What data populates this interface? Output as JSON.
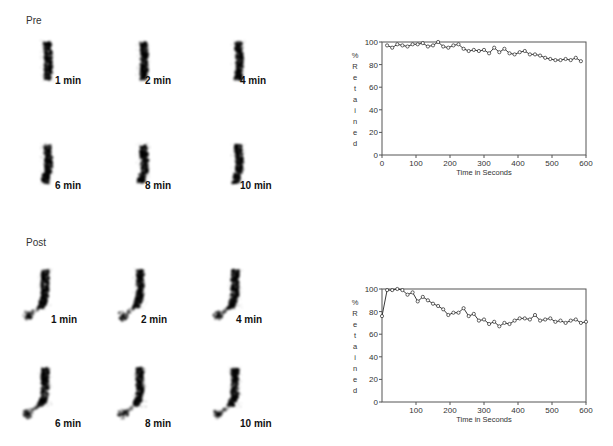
{
  "figure": {
    "panels": [
      {
        "id": "pre",
        "label": "Pre",
        "scans": [
          {
            "label": "1 min"
          },
          {
            "label": "2 min"
          },
          {
            "label": "4 min"
          },
          {
            "label": "6 min"
          },
          {
            "label": "8 min"
          },
          {
            "label": "10 min"
          }
        ]
      },
      {
        "id": "post",
        "label": "Post",
        "scans": [
          {
            "label": "1 min"
          },
          {
            "label": "2 min"
          },
          {
            "label": "4 min"
          },
          {
            "label": "6 min"
          },
          {
            "label": "8 min"
          },
          {
            "label": "10 min"
          }
        ]
      }
    ]
  },
  "chart_data": [
    {
      "type": "line",
      "panel": "Pre",
      "title": "",
      "xlabel": "Time in Seconds",
      "ylabel": "% Retained",
      "xlim": [
        0,
        600
      ],
      "ylim": [
        0,
        100
      ],
      "xticks": [
        0,
        100,
        200,
        300,
        400,
        500,
        600
      ],
      "yticks": [
        0,
        20,
        40,
        60,
        80,
        100
      ],
      "grid": false,
      "marker": "circle-open",
      "series": [
        {
          "name": "Pre",
          "x": [
            15,
            30,
            45,
            60,
            75,
            90,
            105,
            120,
            135,
            150,
            165,
            180,
            195,
            210,
            225,
            240,
            255,
            270,
            285,
            300,
            315,
            330,
            345,
            360,
            375,
            390,
            405,
            420,
            435,
            450,
            465,
            480,
            495,
            510,
            525,
            540,
            555,
            570,
            585
          ],
          "values": [
            97,
            95,
            98,
            97,
            96,
            98,
            98,
            99,
            96,
            97,
            100,
            96,
            95,
            97,
            98,
            94,
            92,
            93,
            92,
            93,
            90,
            95,
            91,
            94,
            90,
            89,
            91,
            92,
            89,
            89,
            88,
            86,
            85,
            84,
            84,
            85,
            84,
            86,
            83
          ]
        }
      ]
    },
    {
      "type": "line",
      "panel": "Post",
      "title": "",
      "xlabel": "Time in Seconds",
      "ylabel": "% Retained",
      "xlim": [
        0,
        600
      ],
      "ylim": [
        0,
        100
      ],
      "xticks": [
        100,
        200,
        300,
        400,
        500,
        600
      ],
      "yticks": [
        0,
        20,
        40,
        60,
        80,
        100
      ],
      "grid": false,
      "marker": "circle-open",
      "series": [
        {
          "name": "Post",
          "x": [
            0,
            15,
            30,
            45,
            60,
            75,
            90,
            105,
            120,
            135,
            150,
            165,
            180,
            195,
            210,
            225,
            240,
            255,
            270,
            285,
            300,
            315,
            330,
            345,
            360,
            375,
            390,
            405,
            420,
            435,
            450,
            465,
            480,
            495,
            510,
            525,
            540,
            555,
            570,
            585,
            600
          ],
          "values": [
            76,
            99,
            99,
            100,
            99,
            95,
            97,
            89,
            93,
            90,
            87,
            85,
            82,
            77,
            79,
            79,
            83,
            76,
            78,
            72,
            73,
            69,
            71,
            67,
            70,
            69,
            72,
            74,
            74,
            73,
            77,
            72,
            73,
            74,
            71,
            72,
            70,
            72,
            73,
            70,
            71
          ]
        }
      ]
    }
  ]
}
